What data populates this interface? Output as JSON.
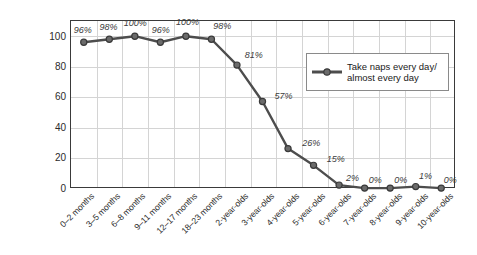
{
  "chart_data": {
    "type": "line",
    "title": "",
    "xlabel": "",
    "ylabel": "Percentage of respondents",
    "ylim": [
      0,
      110
    ],
    "yticks": [
      0,
      20,
      40,
      60,
      80,
      100
    ],
    "grid": true,
    "legend_position": "upper-right",
    "categories": [
      "0–2 months",
      "3–5 months",
      "6–8 months",
      "9–11 months",
      "12–17 months",
      "18–23 months",
      "2-year-olds",
      "3-year-olds",
      "4-year-olds",
      "5-year-olds",
      "6-year-olds",
      "7-year-olds",
      "8-year-olds",
      "9-year-olds",
      "10-year-olds"
    ],
    "series": [
      {
        "name": "Take naps every day/\nalmost every day",
        "values": [
          96,
          98,
          100,
          96,
          100,
          98,
          81,
          57,
          26,
          15,
          2,
          0,
          0,
          1,
          0
        ],
        "point_labels": [
          "96%",
          "98%",
          "100%",
          "96%",
          "100%",
          "98%",
          "81%",
          "57%",
          "26%",
          "15%",
          "2%",
          "0%",
          "0%",
          "1%",
          "0%"
        ],
        "color": "#4d4d4d",
        "marker_color": "#5a5a5a"
      }
    ]
  },
  "colors": {
    "line": "#4d4d4d",
    "marker_fill": "#6b6b6b",
    "marker_stroke": "#3a3a3a",
    "grid": "#d4d4d4",
    "frame": "#3a3a3a",
    "text": "#2b2b2b"
  },
  "legend": {
    "label": "Take naps every day/\nalmost every day"
  },
  "axes": {
    "y_title": "Percentage of respondents",
    "y_tick_labels": [
      "100",
      "80",
      "60",
      "40",
      "20",
      "0"
    ]
  }
}
